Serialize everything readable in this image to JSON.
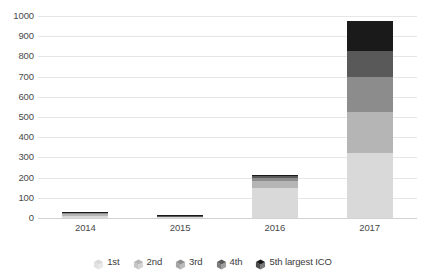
{
  "chart_data": {
    "type": "bar",
    "subtype": "stacked-bar",
    "title": "",
    "subtitle": "",
    "xlabel": "",
    "ylabel": "",
    "categories": [
      "2014",
      "2015",
      "2016",
      "2017"
    ],
    "ylim": [
      0,
      1000
    ],
    "y_ticks": [
      0,
      100,
      200,
      300,
      400,
      500,
      600,
      700,
      800,
      900,
      1000
    ],
    "y_tick_labels": [
      "0",
      "100",
      "200",
      "300",
      "400",
      "500",
      "600",
      "700",
      "800",
      "900",
      "1000"
    ],
    "grid": true,
    "grid_axis": "y",
    "legend_position": "bottom",
    "series": [
      {
        "name": "1st",
        "color": "#d9d9d9",
        "values": [
          12,
          6,
          150,
          323
        ]
      },
      {
        "name": "2nd",
        "color": "#b5b5b5",
        "values": [
          7,
          3,
          32,
          202
        ]
      },
      {
        "name": "3rd",
        "color": "#8c8c8c",
        "values": [
          5,
          2,
          16,
          172
        ]
      },
      {
        "name": "4th",
        "color": "#595959",
        "values": [
          4,
          1,
          9,
          131
        ]
      },
      {
        "name": "5th largest ICO",
        "color": "#1a1a1a",
        "values": [
          2,
          1,
          5,
          147
        ]
      }
    ],
    "totals": [
      30,
      13,
      212,
      975
    ]
  },
  "legend": {
    "items": [
      {
        "label": "1st",
        "icon": "cube-icon",
        "color": "#d9d9d9"
      },
      {
        "label": "2nd",
        "icon": "cube-icon",
        "color": "#b5b5b5"
      },
      {
        "label": "3rd",
        "icon": "cube-icon",
        "color": "#8c8c8c"
      },
      {
        "label": "4th",
        "icon": "cube-icon",
        "color": "#595959"
      },
      {
        "label": "5th largest ICO",
        "icon": "cube-icon",
        "color": "#1a1a1a"
      }
    ]
  },
  "style": {
    "background": "#ffffff",
    "gridline_color": "#e6e6e6",
    "axis_line_color": "#d2d2d2",
    "tick_label_color": "#4a4a4a"
  }
}
